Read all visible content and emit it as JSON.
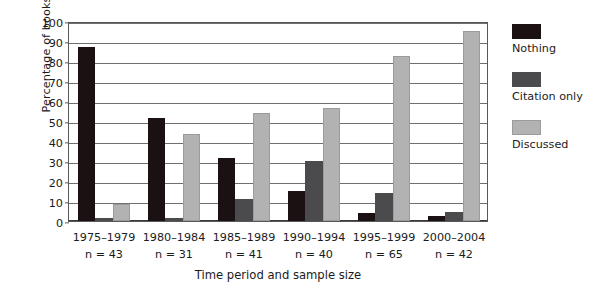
{
  "chart_data": {
    "type": "bar",
    "title": "",
    "xlabel": "Time period and sample size",
    "ylabel": "Percentage of books",
    "ylim": [
      0,
      100
    ],
    "ytick_step": 10,
    "yticks": [
      "100",
      "90",
      "80",
      "70",
      "60",
      "50",
      "40",
      "30",
      "20",
      "10",
      "0"
    ],
    "grid": true,
    "legend_position": "right",
    "categories": [
      "1975–1979",
      "1980–1984",
      "1985–1989",
      "1990–1994",
      "1995–1999",
      "2000–2004"
    ],
    "category_sublabels": [
      "n = 43",
      "n = 31",
      "n = 41",
      "n = 40",
      "n = 65",
      "n = 42"
    ],
    "series": [
      {
        "name": "Nothing",
        "color": "#1b1113",
        "values": [
          87,
          51.5,
          31.5,
          15,
          4,
          2.5
        ]
      },
      {
        "name": "Citation only",
        "color": "#4b4b4d",
        "values": [
          1.5,
          1.5,
          11,
          30,
          14,
          4.5
        ]
      },
      {
        "name": "Discussed",
        "color": "#b2b2b2",
        "values": [
          8.5,
          43.5,
          54,
          56.5,
          82.5,
          95
        ]
      }
    ]
  },
  "legend": {
    "items": [
      {
        "label": "Nothing",
        "swatch": "legend-swatch-nothing"
      },
      {
        "label": "Citation only",
        "swatch": "legend-swatch-citation-only"
      },
      {
        "label": "Discussed",
        "swatch": "legend-swatch-discussed"
      }
    ]
  }
}
